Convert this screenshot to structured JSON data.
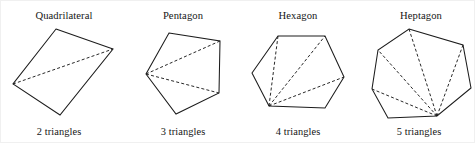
{
  "figure": {
    "name": "polygon-triangulation-figure",
    "width": 475,
    "height": 143,
    "background_color": "#ffffff",
    "stroke_color": "#1c1c1c",
    "text_color": "#161616"
  },
  "panels": [
    {
      "id": "quadrilateral",
      "title": "Quadrilateral",
      "caption": "2 triangles",
      "sides": 4,
      "triangles": 2,
      "diagonals": 1,
      "title_x": 63,
      "title_y": 18,
      "caption_x": 58,
      "caption_y": 134,
      "vertices": [
        [
          55,
          28
        ],
        [
          112,
          48
        ],
        [
          59,
          114
        ],
        [
          12,
          83
        ]
      ],
      "fan_vertex_index": 3,
      "diagonal_targets": [
        1
      ]
    },
    {
      "id": "pentagon",
      "title": "Pentagon",
      "caption": "3 triangles",
      "sides": 5,
      "triangles": 3,
      "diagonals": 2,
      "title_x": 182,
      "title_y": 18,
      "caption_x": 182,
      "caption_y": 134,
      "vertices": [
        [
          168,
          32
        ],
        [
          219,
          40
        ],
        [
          218,
          92
        ],
        [
          175,
          113
        ],
        [
          145,
          73
        ]
      ],
      "fan_vertex_index": 4,
      "diagonal_targets": [
        1,
        2
      ]
    },
    {
      "id": "hexagon",
      "title": "Hexagon",
      "caption": "4 triangles",
      "sides": 6,
      "triangles": 4,
      "diagonals": 3,
      "title_x": 297,
      "title_y": 18,
      "caption_x": 297,
      "caption_y": 134,
      "vertices": [
        [
          277,
          35
        ],
        [
          324,
          35
        ],
        [
          343,
          76
        ],
        [
          324,
          107
        ],
        [
          268,
          105
        ],
        [
          251,
          72
        ]
      ],
      "fan_vertex_index": 4,
      "diagonal_targets": [
        0,
        1,
        2
      ]
    },
    {
      "id": "heptagon",
      "title": "Heptagon",
      "caption": "5 triangles",
      "sides": 7,
      "triangles": 5,
      "diagonals": 4,
      "title_x": 420,
      "title_y": 18,
      "caption_x": 418,
      "caption_y": 134,
      "vertices": [
        [
          408,
          28
        ],
        [
          462,
          44
        ],
        [
          470,
          87
        ],
        [
          436,
          115
        ],
        [
          387,
          117
        ],
        [
          371,
          88
        ],
        [
          377,
          49
        ]
      ],
      "fan_vertex_index": 3,
      "diagonal_targets": [
        0,
        1,
        5,
        6
      ]
    }
  ]
}
